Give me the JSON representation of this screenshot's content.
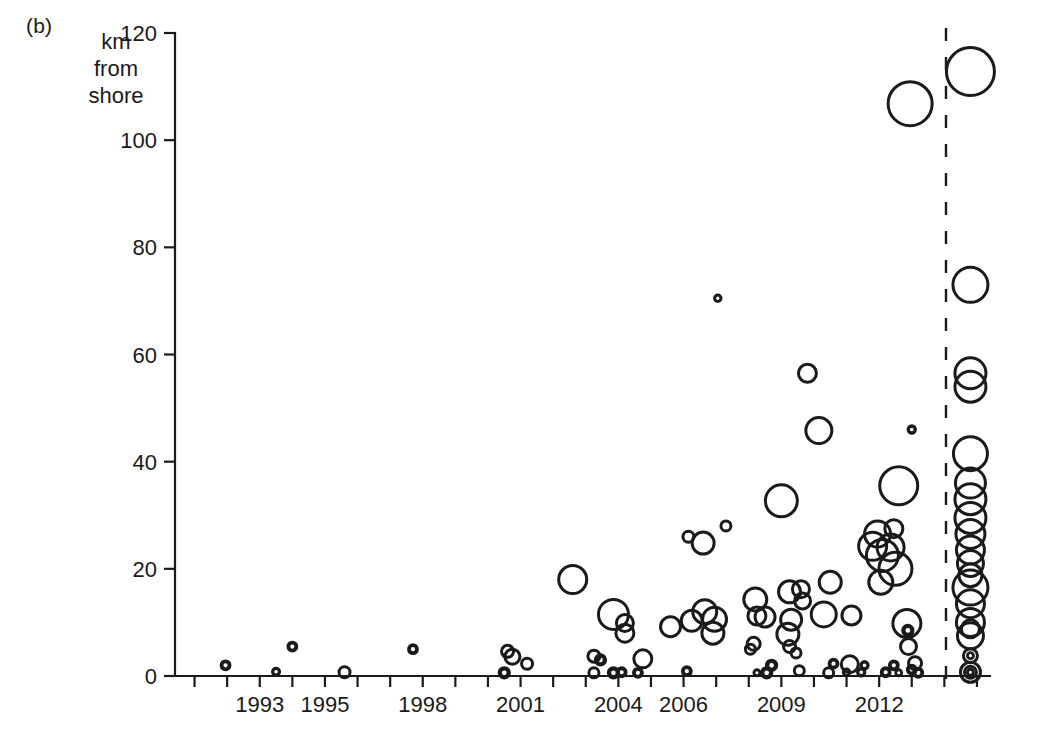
{
  "figure": {
    "panel_label": "(b)",
    "y_axis_title_lines": [
      "km",
      "from",
      "shore"
    ]
  },
  "chart_data": {
    "type": "scatter",
    "title": "",
    "subtitle": "",
    "xlabel": "",
    "ylabel": "km from shore",
    "xlim": [
      1990.4,
      2015.4
    ],
    "ylim": [
      0,
      120
    ],
    "grid": false,
    "legend": null,
    "y_ticks": [
      0,
      20,
      40,
      60,
      80,
      100,
      120
    ],
    "y_tick_labels": [
      "0",
      "20",
      "40",
      "60",
      "80",
      "100",
      "120"
    ],
    "x_ticks": [
      1991,
      1992,
      1993,
      1994,
      1995,
      1996,
      1997,
      1998,
      1999,
      2000,
      2001,
      2002,
      2003,
      2004,
      2005,
      2006,
      2007,
      2008,
      2009,
      2010,
      2011,
      2012,
      2013,
      2014,
      2015
    ],
    "x_tick_labels_shown": [
      "1993",
      "1995",
      "1998",
      "2001",
      "2004",
      "2006",
      "2009",
      "2012"
    ],
    "x_tick_labels_shown_values": [
      1993,
      1995,
      1998,
      2001,
      2004,
      2006,
      2009,
      2012
    ],
    "annotations": [
      {
        "name": "projection-divider",
        "type": "vertical-dashed-line",
        "x": 2014.05,
        "label": ""
      }
    ],
    "marker_style": {
      "shape": "open-circle",
      "fill": "none",
      "stroke": "#1a1a1a",
      "size_encodes": "project capacity",
      "size_range_px": [
        3,
        36
      ]
    },
    "points": [
      {
        "x": 1991.95,
        "y": 2.0,
        "r": 4.0
      },
      {
        "x": 1994.0,
        "y": 5.5,
        "r": 4.0
      },
      {
        "x": 1993.5,
        "y": 0.8,
        "r": 3.4
      },
      {
        "x": 1995.6,
        "y": 0.7,
        "r": 5.5
      },
      {
        "x": 1997.7,
        "y": 5.0,
        "r": 4.0
      },
      {
        "x": 2000.6,
        "y": 4.6,
        "r": 6.0
      },
      {
        "x": 2000.75,
        "y": 3.6,
        "r": 7.5
      },
      {
        "x": 2001.2,
        "y": 2.3,
        "r": 5.5
      },
      {
        "x": 2000.5,
        "y": 0.6,
        "r": 4.5
      },
      {
        "x": 2002.6,
        "y": 18.0,
        "r": 14.0
      },
      {
        "x": 2003.25,
        "y": 3.7,
        "r": 6.0
      },
      {
        "x": 2003.45,
        "y": 3.0,
        "r": 4.5
      },
      {
        "x": 2003.25,
        "y": 0.6,
        "r": 5.0
      },
      {
        "x": 2003.85,
        "y": 11.5,
        "r": 15.0
      },
      {
        "x": 2004.2,
        "y": 9.9,
        "r": 8.5
      },
      {
        "x": 2004.2,
        "y": 8.0,
        "r": 9.0
      },
      {
        "x": 2003.85,
        "y": 0.6,
        "r": 4.5
      },
      {
        "x": 2004.1,
        "y": 0.7,
        "r": 4.0
      },
      {
        "x": 2004.75,
        "y": 3.2,
        "r": 9.0
      },
      {
        "x": 2004.6,
        "y": 0.6,
        "r": 4.0
      },
      {
        "x": 2005.6,
        "y": 9.2,
        "r": 10.0
      },
      {
        "x": 2006.1,
        "y": 0.9,
        "r": 4.0
      },
      {
        "x": 2006.25,
        "y": 10.3,
        "r": 10.5
      },
      {
        "x": 2006.65,
        "y": 12.0,
        "r": 12.0
      },
      {
        "x": 2006.95,
        "y": 10.6,
        "r": 12.0
      },
      {
        "x": 2006.9,
        "y": 8.0,
        "r": 11.0
      },
      {
        "x": 2006.6,
        "y": 24.8,
        "r": 11.0
      },
      {
        "x": 2006.15,
        "y": 26.0,
        "r": 5.5
      },
      {
        "x": 2007.05,
        "y": 70.5,
        "r": 3.2
      },
      {
        "x": 2007.3,
        "y": 28.0,
        "r": 5.0
      },
      {
        "x": 2008.2,
        "y": 14.3,
        "r": 11.5
      },
      {
        "x": 2008.25,
        "y": 11.2,
        "r": 9.0
      },
      {
        "x": 2008.15,
        "y": 6.0,
        "r": 6.5
      },
      {
        "x": 2008.05,
        "y": 5.0,
        "r": 5.0
      },
      {
        "x": 2008.5,
        "y": 11.0,
        "r": 10.0
      },
      {
        "x": 2008.7,
        "y": 2.0,
        "r": 4.5
      },
      {
        "x": 2008.55,
        "y": 0.6,
        "r": 4.5
      },
      {
        "x": 2008.25,
        "y": 0.6,
        "r": 3.0
      },
      {
        "x": 2009.0,
        "y": 32.7,
        "r": 16.0
      },
      {
        "x": 2009.25,
        "y": 15.7,
        "r": 11.0
      },
      {
        "x": 2009.3,
        "y": 10.5,
        "r": 10.5
      },
      {
        "x": 2009.2,
        "y": 7.8,
        "r": 11.0
      },
      {
        "x": 2009.25,
        "y": 5.5,
        "r": 6.0
      },
      {
        "x": 2009.45,
        "y": 4.3,
        "r": 5.0
      },
      {
        "x": 2009.6,
        "y": 16.2,
        "r": 8.5
      },
      {
        "x": 2009.65,
        "y": 14.0,
        "r": 8.0
      },
      {
        "x": 2009.55,
        "y": 1.0,
        "r": 5.0
      },
      {
        "x": 2009.8,
        "y": 56.5,
        "r": 9.0
      },
      {
        "x": 2010.15,
        "y": 45.8,
        "r": 13.0
      },
      {
        "x": 2010.5,
        "y": 17.5,
        "r": 11.0
      },
      {
        "x": 2010.3,
        "y": 11.5,
        "r": 12.5
      },
      {
        "x": 2010.6,
        "y": 2.3,
        "r": 4.0
      },
      {
        "x": 2010.45,
        "y": 0.6,
        "r": 5.0
      },
      {
        "x": 2011.15,
        "y": 11.3,
        "r": 9.5
      },
      {
        "x": 2011.1,
        "y": 2.2,
        "r": 8.5
      },
      {
        "x": 2011.0,
        "y": 0.7,
        "r": 3.2
      },
      {
        "x": 2011.55,
        "y": 2.0,
        "r": 3.5
      },
      {
        "x": 2011.45,
        "y": 0.7,
        "r": 3.5
      },
      {
        "x": 2011.8,
        "y": 24.2,
        "r": 14.0
      },
      {
        "x": 2011.95,
        "y": 26.5,
        "r": 13.0
      },
      {
        "x": 2012.1,
        "y": 22.5,
        "r": 16.0
      },
      {
        "x": 2012.35,
        "y": 24.0,
        "r": 13.5
      },
      {
        "x": 2012.5,
        "y": 20.0,
        "r": 16.5
      },
      {
        "x": 2012.05,
        "y": 17.5,
        "r": 12.0
      },
      {
        "x": 2012.45,
        "y": 27.5,
        "r": 9.0
      },
      {
        "x": 2012.6,
        "y": 35.5,
        "r": 19.0
      },
      {
        "x": 2012.95,
        "y": 106.8,
        "r": 22.0
      },
      {
        "x": 2013.0,
        "y": 46.0,
        "r": 3.5
      },
      {
        "x": 2012.85,
        "y": 9.8,
        "r": 14.0
      },
      {
        "x": 2012.88,
        "y": 8.5,
        "r": 4.5
      },
      {
        "x": 2012.9,
        "y": 5.5,
        "r": 8.0
      },
      {
        "x": 2012.45,
        "y": 2.0,
        "r": 4.0
      },
      {
        "x": 2012.2,
        "y": 0.7,
        "r": 4.0
      },
      {
        "x": 2012.6,
        "y": 0.6,
        "r": 3.0
      },
      {
        "x": 2013.1,
        "y": 2.4,
        "r": 6.5
      },
      {
        "x": 2013.0,
        "y": 1.2,
        "r": 4.0
      },
      {
        "x": 2013.2,
        "y": 0.6,
        "r": 4.0
      },
      {
        "x": 2014.8,
        "y": 112.8,
        "r": 24.0
      },
      {
        "x": 2014.8,
        "y": 73.0,
        "r": 17.5
      },
      {
        "x": 2014.8,
        "y": 56.5,
        "r": 15.5
      },
      {
        "x": 2014.8,
        "y": 54.0,
        "r": 15.5
      },
      {
        "x": 2014.8,
        "y": 41.5,
        "r": 17.0
      },
      {
        "x": 2014.8,
        "y": 36.0,
        "r": 15.0
      },
      {
        "x": 2014.8,
        "y": 33.0,
        "r": 15.5
      },
      {
        "x": 2014.8,
        "y": 29.5,
        "r": 15.5
      },
      {
        "x": 2014.8,
        "y": 26.5,
        "r": 14.5
      },
      {
        "x": 2014.8,
        "y": 23.5,
        "r": 14.0
      },
      {
        "x": 2014.8,
        "y": 21.0,
        "r": 13.0
      },
      {
        "x": 2014.8,
        "y": 18.8,
        "r": 11.5
      },
      {
        "x": 2014.8,
        "y": 16.5,
        "r": 17.5
      },
      {
        "x": 2014.8,
        "y": 13.5,
        "r": 14.0
      },
      {
        "x": 2014.8,
        "y": 10.0,
        "r": 14.0
      },
      {
        "x": 2014.8,
        "y": 8.8,
        "r": 9.0
      },
      {
        "x": 2014.8,
        "y": 7.5,
        "r": 13.0
      },
      {
        "x": 2014.8,
        "y": 3.8,
        "r": 7.0
      },
      {
        "x": 2014.8,
        "y": 3.8,
        "r": 3.0
      },
      {
        "x": 2014.8,
        "y": 0.7,
        "r": 10.0
      },
      {
        "x": 2014.8,
        "y": 0.7,
        "r": 6.0
      },
      {
        "x": 2014.8,
        "y": 0.7,
        "r": 3.0
      }
    ]
  }
}
